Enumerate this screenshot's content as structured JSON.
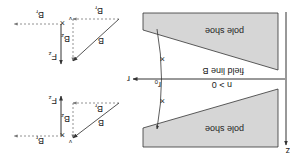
{
  "figure": {
    "orientation": "rotated 180 degrees",
    "axes": {
      "z_label": "z",
      "r_label": "r",
      "r0_label": "r",
      "r0_sub": "0"
    },
    "pole_shoes": [
      {
        "label": "pole shoe",
        "position": "upper"
      },
      {
        "label": "pole shoe",
        "position": "lower"
      }
    ],
    "field_line_label": "field line B",
    "condition_label": "n > 0",
    "vector_diagrams": {
      "upper_force": {
        "velocity": "v",
        "br": "B",
        "br_sub": "r",
        "force": "F",
        "force_sub": "z"
      },
      "upper_field": {
        "b": "B",
        "br": "B",
        "br_sub": "r",
        "bz": "B",
        "bz_sub": "z"
      },
      "lower_force": {
        "velocity": "v",
        "br": "B",
        "br_sub": "r",
        "force": "F",
        "force_sub": "z"
      },
      "lower_field": {
        "b": "B",
        "br": "B",
        "br_sub": "r",
        "bz": "B",
        "bz_sub": "z"
      }
    },
    "colors": {
      "pole_fill": "#d6d6d6",
      "line": "#333333",
      "dashed": "#777777"
    }
  }
}
